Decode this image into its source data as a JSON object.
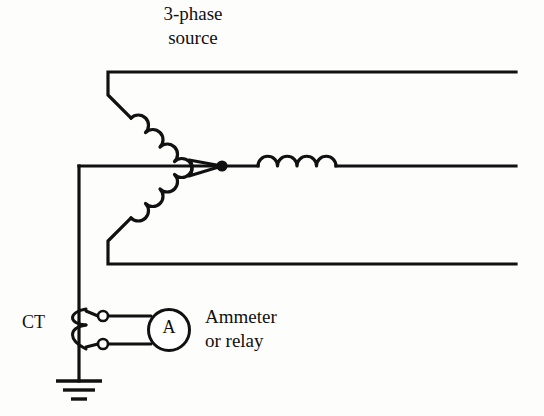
{
  "diagram": {
    "background_color": "#fdfdfc",
    "line_color": "#111111",
    "labels": {
      "source": "3-phase\nsource",
      "ct": "CT",
      "meter": "Ammeter\nor relay",
      "ammeter_symbol": "A"
    },
    "components": [
      {
        "name": "phase-line-top",
        "type": "conductor",
        "description": "Top phase conductor running to the right edge"
      },
      {
        "name": "phase-line-middle",
        "type": "conductor",
        "description": "Middle phase conductor through series coil"
      },
      {
        "name": "phase-line-bottom",
        "type": "conductor",
        "description": "Bottom phase conductor running to the right edge"
      },
      {
        "name": "winding-upper",
        "type": "coil",
        "turns": 4,
        "description": "Upper wye winding, diagonal"
      },
      {
        "name": "winding-lower",
        "type": "coil",
        "turns": 4,
        "description": "Lower wye winding, diagonal"
      },
      {
        "name": "winding-middle",
        "type": "coil",
        "turns": 4,
        "description": "Middle wye winding, horizontal"
      },
      {
        "name": "neutral-node",
        "type": "junction-dot",
        "description": "Wye star point where three windings meet"
      },
      {
        "name": "neutral-conductor",
        "type": "conductor",
        "description": "Neutral lead from star point down to ground"
      },
      {
        "name": "current-transformer",
        "type": "ct-coil",
        "turns": 2,
        "description": "Current transformer around the neutral conductor"
      },
      {
        "name": "terminal-upper",
        "type": "terminal",
        "description": "Upper CT secondary terminal"
      },
      {
        "name": "terminal-lower",
        "type": "terminal",
        "description": "Lower CT secondary terminal"
      },
      {
        "name": "ammeter",
        "type": "meter",
        "description": "Ammeter or relay connected to CT secondary"
      },
      {
        "name": "ground",
        "type": "earth-ground",
        "bars": 3,
        "description": "Earth ground symbol at bottom of neutral"
      }
    ],
    "geometry": {
      "top_line_y": 72,
      "middle_line_y": 166,
      "bottom_line_y": 264,
      "right_edge_x": 516,
      "left_bend_x": 108,
      "star_node_x": 222,
      "star_node_y": 166,
      "neutral_x": 79,
      "ct_terminal_x": 103,
      "terminal_upper_y": 316,
      "terminal_lower_y": 344,
      "ammeter_cx": 169,
      "ammeter_cy": 330,
      "ammeter_r": 20,
      "ground_y": 381
    }
  }
}
